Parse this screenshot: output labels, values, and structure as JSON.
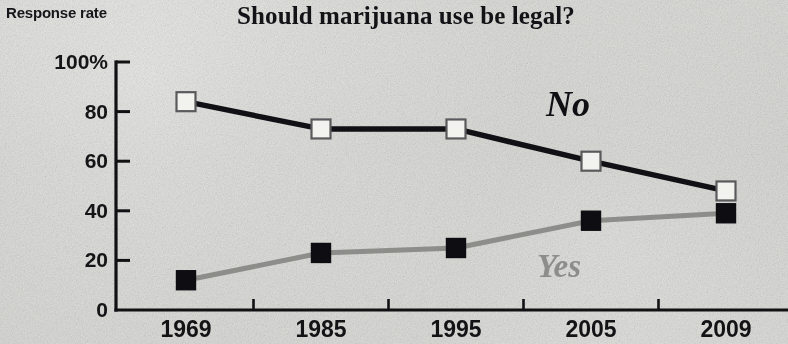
{
  "axis": {
    "y_axis_title": "Response rate",
    "y_ticks": [
      "100%",
      "80",
      "60",
      "40",
      "20",
      "0"
    ],
    "x_ticks": [
      "1969",
      "1985",
      "1995",
      "2005",
      "2009"
    ]
  },
  "annotations": {
    "no_label": "No",
    "yes_label": "Yes"
  },
  "colors": {
    "background": "#cfcfcb",
    "no_series": "#111115",
    "yes_series": "#8d8d8a",
    "axis": "#111114",
    "text": "#131316"
  },
  "chart_data": {
    "type": "line",
    "title": "Should marijuana use be legal?",
    "xlabel": "",
    "ylabel": "Response rate",
    "ylim": [
      0,
      100
    ],
    "yticks": [
      0,
      20,
      40,
      60,
      80,
      100
    ],
    "grid": false,
    "legend": "inline-annotation",
    "categories": [
      "1969",
      "1985",
      "1995",
      "2005",
      "2009"
    ],
    "series": [
      {
        "name": "No",
        "color": "#111115",
        "marker": "white-square",
        "values": [
          84,
          73,
          73,
          60,
          48
        ]
      },
      {
        "name": "Yes",
        "color": "#8d8d8a",
        "marker": "black-square",
        "values": [
          12,
          23,
          25,
          36,
          39
        ]
      }
    ]
  }
}
